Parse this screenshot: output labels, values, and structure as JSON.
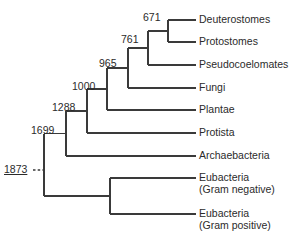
{
  "figure": {
    "type": "cladogram",
    "stroke_color": "#3a3a3a",
    "text_color": "#2b2b2b",
    "background_color": "#ffffff"
  },
  "tips": [
    {
      "id": "deuterostomes",
      "label": "Deuterostomes",
      "line2": "",
      "y": 20,
      "line_start_x": 178,
      "line_end_x": 196,
      "label_x": 199
    },
    {
      "id": "protostomes",
      "label": "Protostomes",
      "line2": "",
      "y": 42,
      "line_start_x": 178,
      "line_end_x": 196,
      "label_x": 199
    },
    {
      "id": "pseudocoelomates",
      "label": "Pseudocoelomates",
      "line2": "",
      "y": 65,
      "line_start_x": 178,
      "line_end_x": 196,
      "label_x": 199
    },
    {
      "id": "fungi",
      "label": "Fungi",
      "line2": "",
      "y": 88,
      "line_start_x": 178,
      "line_end_x": 196,
      "label_x": 199
    },
    {
      "id": "plantae",
      "label": "Plantae",
      "line2": "",
      "y": 110,
      "line_start_x": 178,
      "line_end_x": 196,
      "label_x": 199
    },
    {
      "id": "protista",
      "label": "Protista",
      "line2": "",
      "y": 133,
      "line_start_x": 178,
      "line_end_x": 196,
      "label_x": 199
    },
    {
      "id": "archaebacteria",
      "label": "Archaebacteria",
      "line2": "",
      "y": 156,
      "line_start_x": 178,
      "line_end_x": 196,
      "label_x": 199
    },
    {
      "id": "eubacteria-gram-negative",
      "label": "Eubacteria",
      "line2": "(Gram negative)",
      "y": 178,
      "line_start_x": 178,
      "line_end_x": 196,
      "label_x": 199
    },
    {
      "id": "eubacteria-gram-positive",
      "label": "Eubacteria",
      "line2": "(Gram positive)",
      "y": 214,
      "line_start_x": 178,
      "line_end_x": 196,
      "label_x": 199
    }
  ],
  "nodes": [
    {
      "id": "node-671",
      "label": "671",
      "x": 168,
      "y_top": 20,
      "y_bottom": 42,
      "label_x": 143,
      "label_y": 11
    },
    {
      "id": "node-761",
      "label": "761",
      "x": 148,
      "y_top": 31,
      "y_bottom": 65,
      "label_x": 121,
      "label_y": 33
    },
    {
      "id": "node-965",
      "label": "965",
      "x": 128,
      "y_top": 48,
      "y_bottom": 88,
      "label_x": 99,
      "label_y": 57
    },
    {
      "id": "node-1000",
      "label": "1000",
      "x": 107,
      "y_top": 68,
      "y_bottom": 110,
      "label_x": 72,
      "label_y": 80
    },
    {
      "id": "node-1288",
      "label": "1288",
      "x": 87,
      "y_top": 89,
      "y_bottom": 133,
      "label_x": 52,
      "label_y": 101
    },
    {
      "id": "node-1699",
      "label": "1699",
      "x": 66,
      "y_top": 111,
      "y_bottom": 156,
      "label_x": 31,
      "label_y": 124
    },
    {
      "id": "node-eubacteria",
      "label": "",
      "x": 110,
      "y_top": 178,
      "y_bottom": 214,
      "label_x": 0,
      "label_y": 0
    }
  ],
  "root": {
    "id": "node-1873",
    "label": "1873",
    "x": 44,
    "y_top": 134,
    "y_bottom": 196,
    "label_x": 4,
    "label_y": 163,
    "dash_start_x": 33,
    "dash_end_x": 44,
    "dash_y": 170
  },
  "chart_data": {
    "type": "tree",
    "leaves": [
      "Deuterostomes",
      "Protostomes",
      "Pseudocoelomates",
      "Fungi",
      "Plantae",
      "Protista",
      "Archaebacteria",
      "Eubacteria (Gram negative)",
      "Eubacteria (Gram positive)"
    ],
    "node_values": [
      671,
      761,
      965,
      1000,
      1288,
      1699,
      1873
    ],
    "newick": "((((((Deuterostomes,Protostomes)671,Pseudocoelomates)761,Fungi)965,Plantae)1000,Protista)1288,Archaebacteria)1699,(Eubacteria_Gram_negative,Eubacteria_Gram_positive))1873;"
  }
}
